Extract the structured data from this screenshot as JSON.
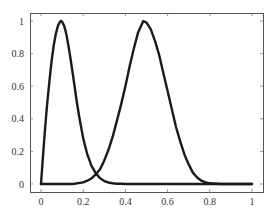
{
  "chart_data": {
    "type": "line",
    "title": "",
    "xlabel": "",
    "ylabel": "",
    "xlim": [
      0,
      1
    ],
    "ylim": [
      0,
      1
    ],
    "grid": false,
    "legend": null,
    "x_ticks": [
      "0",
      "0.2",
      "0.4",
      "0.6",
      "0.8",
      "1"
    ],
    "y_ticks": [
      "0",
      "0.2",
      "0.4",
      "0.6",
      "0.8",
      "1"
    ],
    "series": [
      {
        "name": "curve-1",
        "color": "#1a1a1a",
        "x": [
          0,
          0.0,
          0.01,
          0.02,
          0.03,
          0.04,
          0.05,
          0.06,
          0.07,
          0.08,
          0.09,
          0.095,
          0.1,
          0.11,
          0.12,
          0.13,
          0.14,
          0.15,
          0.16,
          0.17,
          0.18,
          0.19,
          0.2,
          0.22,
          0.24,
          0.26,
          0.28,
          0.3,
          0.32,
          0.34,
          0.36,
          0.38,
          0.4,
          0.45,
          0.5,
          0.6,
          0.7,
          0.8,
          0.9,
          1.0
        ],
        "y": [
          0,
          0.0,
          0.18,
          0.35,
          0.5,
          0.63,
          0.75,
          0.85,
          0.92,
          0.97,
          0.995,
          1.0,
          0.995,
          0.97,
          0.92,
          0.85,
          0.77,
          0.68,
          0.59,
          0.5,
          0.42,
          0.35,
          0.28,
          0.18,
          0.11,
          0.065,
          0.035,
          0.018,
          0.009,
          0.004,
          0.002,
          0.001,
          0.0,
          0.0,
          0.0,
          0.0,
          0.0,
          0.0,
          0.0,
          0.0
        ]
      },
      {
        "name": "curve-2",
        "color": "#1a1a1a",
        "x": [
          0.0,
          0.1,
          0.15,
          0.2,
          0.22,
          0.24,
          0.26,
          0.28,
          0.3,
          0.32,
          0.34,
          0.36,
          0.38,
          0.4,
          0.42,
          0.44,
          0.46,
          0.485,
          0.5,
          0.52,
          0.54,
          0.56,
          0.58,
          0.6,
          0.62,
          0.64,
          0.66,
          0.68,
          0.7,
          0.72,
          0.74,
          0.76,
          0.78,
          0.8,
          0.85,
          0.9,
          1.0
        ],
        "y": [
          0.0,
          0.0,
          0.0,
          0.01,
          0.02,
          0.035,
          0.06,
          0.09,
          0.145,
          0.21,
          0.29,
          0.39,
          0.49,
          0.6,
          0.72,
          0.83,
          0.93,
          1.0,
          0.99,
          0.95,
          0.88,
          0.79,
          0.68,
          0.57,
          0.46,
          0.35,
          0.26,
          0.18,
          0.12,
          0.07,
          0.04,
          0.02,
          0.01,
          0.004,
          0.0,
          0.0,
          0.0
        ]
      }
    ]
  },
  "plot_area": {
    "frame": {
      "left": 30,
      "top": 13,
      "right": 263,
      "bottom": 192
    },
    "x_map": {
      "v0": 0,
      "px0": 41,
      "v1": 1,
      "px1": 252
    },
    "y_map": {
      "v0": 0,
      "px0": 184,
      "v1": 1,
      "px1": 21
    }
  }
}
